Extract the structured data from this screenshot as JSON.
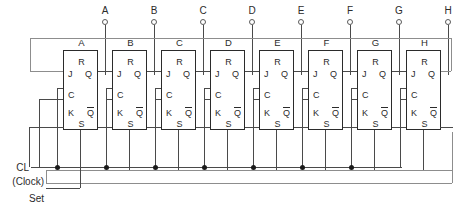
{
  "diagram": {
    "stage_count": 8,
    "colors": {
      "wire": "#4a4a4a",
      "wire_light": "#8d8d8d",
      "block_border": "#2b2b2b",
      "text": "#2b2b2b",
      "junction": "#1a1a1a",
      "background": "#ffffff"
    }
  },
  "output_terminals": [
    {
      "label": "A"
    },
    {
      "label": "B"
    },
    {
      "label": "C"
    },
    {
      "label": "D"
    },
    {
      "label": "E"
    },
    {
      "label": "F"
    },
    {
      "label": "G"
    },
    {
      "label": "H"
    }
  ],
  "flipflops": [
    {
      "name": "A",
      "pins": {
        "r": "R",
        "j": "J",
        "q": "Q",
        "c": "C",
        "k": "K",
        "qbar": "Q",
        "s": "S"
      }
    },
    {
      "name": "B",
      "pins": {
        "r": "R",
        "j": "J",
        "q": "Q",
        "c": "C",
        "k": "K",
        "qbar": "Q",
        "s": "S"
      }
    },
    {
      "name": "C",
      "pins": {
        "r": "R",
        "j": "J",
        "q": "Q",
        "c": "C",
        "k": "K",
        "qbar": "Q",
        "s": "S"
      }
    },
    {
      "name": "D",
      "pins": {
        "r": "R",
        "j": "J",
        "q": "Q",
        "c": "C",
        "k": "K",
        "qbar": "Q",
        "s": "S"
      }
    },
    {
      "name": "E",
      "pins": {
        "r": "R",
        "j": "J",
        "q": "Q",
        "c": "C",
        "k": "K",
        "qbar": "Q",
        "s": "S"
      }
    },
    {
      "name": "F",
      "pins": {
        "r": "R",
        "j": "J",
        "q": "Q",
        "c": "C",
        "k": "K",
        "qbar": "Q",
        "s": "S"
      }
    },
    {
      "name": "G",
      "pins": {
        "r": "R",
        "j": "J",
        "q": "Q",
        "c": "C",
        "k": "K",
        "qbar": "Q",
        "s": "S"
      }
    },
    {
      "name": "H",
      "pins": {
        "r": "R",
        "j": "J",
        "q": "Q",
        "c": "C",
        "k": "K",
        "qbar": "Q",
        "s": "S"
      }
    }
  ],
  "input_labels": {
    "clock": "CL",
    "clock_note": "(Clock)",
    "set": "Set"
  }
}
